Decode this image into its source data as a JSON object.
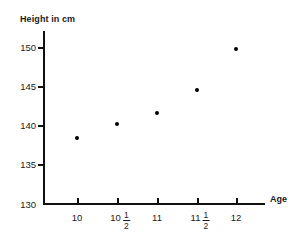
{
  "chart_data": {
    "type": "scatter",
    "title": "",
    "xlabel": "Age",
    "ylabel": "Height in cm",
    "xlim": [
      9.75,
      12.4
    ],
    "ylim": [
      130,
      152
    ],
    "grid": false,
    "legend": "none",
    "x_tick_labels": [
      "10",
      "10 1/2",
      "11",
      "11 1/2",
      "12"
    ],
    "x_tick_values": [
      10,
      10.5,
      11,
      11.5,
      12
    ],
    "y_tick_labels": [
      "130",
      "135",
      "140",
      "145",
      "150"
    ],
    "y_tick_values": [
      130,
      135,
      140,
      145,
      150
    ],
    "x": [
      10,
      10.5,
      11,
      11.5,
      12
    ],
    "values": [
      138.4,
      140.2,
      141.6,
      144.5,
      149.7
    ],
    "points": [
      {
        "age_label": "10",
        "x": 10,
        "y": 138.4
      },
      {
        "age_label": "10 1/2",
        "x": 10.5,
        "y": 140.2
      },
      {
        "age_label": "11",
        "x": 11,
        "y": 141.6
      },
      {
        "age_label": "11 1/2",
        "x": 11.5,
        "y": 144.5
      },
      {
        "age_label": "12",
        "x": 12,
        "y": 149.7
      }
    ],
    "marker_color": "#000000",
    "axis_color": "#111111"
  },
  "axes": {
    "y_title": "Height in cm",
    "x_title": "Age"
  },
  "y_ticks": [
    {
      "label": "150"
    },
    {
      "label": "145"
    },
    {
      "label": "140"
    },
    {
      "label": "135"
    },
    {
      "label": "130"
    }
  ],
  "x_ticks": [
    {
      "whole": "10",
      "num": "",
      "den": ""
    },
    {
      "whole": "10",
      "num": "1",
      "den": "2"
    },
    {
      "whole": "11",
      "num": "",
      "den": ""
    },
    {
      "whole": "11",
      "num": "1",
      "den": "2"
    },
    {
      "whole": "12",
      "num": "",
      "den": ""
    }
  ]
}
